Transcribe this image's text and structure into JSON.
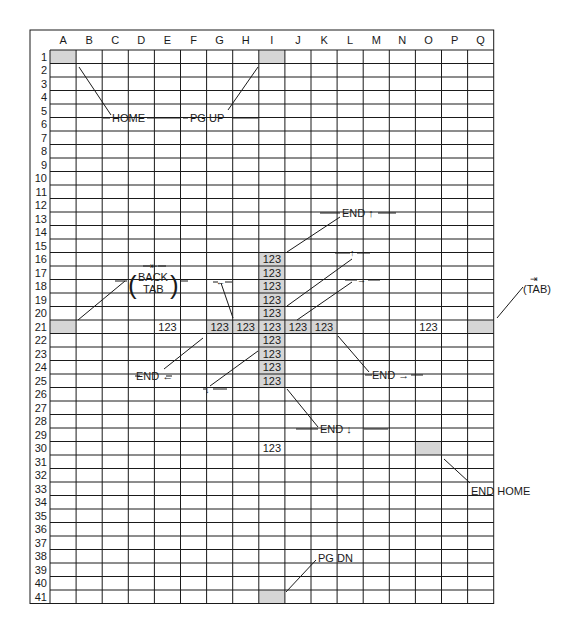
{
  "grid": {
    "columns": [
      "A",
      "B",
      "C",
      "D",
      "E",
      "F",
      "G",
      "H",
      "I",
      "J",
      "K",
      "L",
      "M",
      "N",
      "O",
      "P",
      "Q"
    ],
    "row_count": 41,
    "shaded_cells": [
      {
        "col": "A",
        "row": 1
      },
      {
        "col": "I",
        "row": 1
      },
      {
        "col": "A",
        "row": 21
      },
      {
        "col": "Q",
        "row": 21
      },
      {
        "col": "G",
        "row": 21
      },
      {
        "col": "H",
        "row": 21
      },
      {
        "col": "I",
        "row": 16
      },
      {
        "col": "I",
        "row": 17
      },
      {
        "col": "I",
        "row": 18
      },
      {
        "col": "I",
        "row": 19
      },
      {
        "col": "I",
        "row": 20
      },
      {
        "col": "I",
        "row": 21
      },
      {
        "col": "I",
        "row": 22
      },
      {
        "col": "I",
        "row": 23
      },
      {
        "col": "I",
        "row": 24
      },
      {
        "col": "I",
        "row": 25
      },
      {
        "col": "J",
        "row": 21
      },
      {
        "col": "K",
        "row": 21
      },
      {
        "col": "O",
        "row": 30
      },
      {
        "col": "I",
        "row": 41
      }
    ],
    "cell_values": [
      {
        "col": "I",
        "row": 16,
        "text": "123"
      },
      {
        "col": "I",
        "row": 17,
        "text": "123"
      },
      {
        "col": "I",
        "row": 18,
        "text": "123"
      },
      {
        "col": "I",
        "row": 19,
        "text": "123"
      },
      {
        "col": "I",
        "row": 20,
        "text": "123"
      },
      {
        "col": "E",
        "row": 21,
        "text": "123"
      },
      {
        "col": "G",
        "row": 21,
        "text": "123"
      },
      {
        "col": "H",
        "row": 21,
        "text": "123"
      },
      {
        "col": "I",
        "row": 21,
        "text": "123"
      },
      {
        "col": "J",
        "row": 21,
        "text": "123"
      },
      {
        "col": "K",
        "row": 21,
        "text": "123"
      },
      {
        "col": "O",
        "row": 21,
        "text": "123"
      },
      {
        "col": "I",
        "row": 22,
        "text": "123"
      },
      {
        "col": "I",
        "row": 23,
        "text": "123"
      },
      {
        "col": "I",
        "row": 24,
        "text": "123"
      },
      {
        "col": "I",
        "row": 25,
        "text": "123"
      },
      {
        "col": "I",
        "row": 30,
        "text": "123"
      }
    ]
  },
  "labels": {
    "home": "HOME",
    "pg_up": "PG UP",
    "end_up": "END ↑",
    "back_tab_line1": "BACK",
    "back_tab_line2": "TAB",
    "tab": "(TAB)",
    "end_left": "END ←",
    "end_right": "END →",
    "end_down": "END ↓",
    "end_home": "END HOME",
    "pg_dn": "PG DN",
    "arrow_left_bar": "⇤",
    "arrow_right_bar": "⇥",
    "arrow_up": "↑",
    "arrow_down": "↓",
    "arrow_left": "←",
    "arrow_right": "→"
  }
}
